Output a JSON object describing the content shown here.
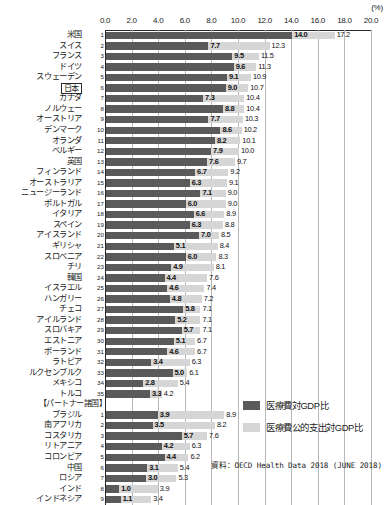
{
  "unit_label": "(%)",
  "source_note": "資料：OECD Health Data 2018 (JUNE 2018)",
  "legend": {
    "total_label": "医療費対GDP比",
    "public_label": "医療費公的支出対GDP比"
  },
  "partner_header": "【パートナー諸国】",
  "colors": {
    "total_bar": "#5a5a5a",
    "public_bar": "#d6d6d6",
    "grid": "#b8b8b8",
    "axis": "#2b2b2b",
    "text": "#1a1a1a",
    "background": "#ffffff"
  },
  "chart_data": {
    "type": "bar",
    "orientation": "horizontal",
    "title": "",
    "subtitle": "",
    "xlabel": "(%)",
    "ylabel": "",
    "xlim": [
      0.0,
      20.0
    ],
    "xticks": [
      "0.0",
      "2.0",
      "4.0",
      "6.0",
      "8.0",
      "10.0",
      "12.0",
      "14.0",
      "16.0",
      "18.0",
      "20.0"
    ],
    "xtick_values": [
      0.0,
      2.0,
      4.0,
      6.0,
      8.0,
      10.0,
      12.0,
      14.0,
      16.0,
      18.0,
      20.0
    ],
    "grid": true,
    "legend_position": "right-bottom",
    "series": [
      {
        "name": "医療費対GDP比",
        "color": "#5a5a5a"
      },
      {
        "name": "医療費公的支出対GDP比",
        "color": "#d6d6d6"
      }
    ],
    "groups": [
      {
        "name": "OECD諸国",
        "header": "",
        "rows": [
          {
            "rank": "1",
            "category": "米国",
            "total": 14.0,
            "public": 17.2,
            "highlight": false
          },
          {
            "rank": "2",
            "category": "スイス",
            "total": 7.7,
            "public": 12.3,
            "highlight": false
          },
          {
            "rank": "3",
            "category": "フランス",
            "total": 9.5,
            "public": 11.5,
            "highlight": false
          },
          {
            "rank": "4",
            "category": "ドイツ",
            "total": 9.6,
            "public": 11.3,
            "highlight": false
          },
          {
            "rank": "5",
            "category": "スウェーデン",
            "total": 9.1,
            "public": 10.9,
            "highlight": false
          },
          {
            "rank": "6",
            "category": "日本",
            "total": 9.0,
            "public": 10.7,
            "highlight": true
          },
          {
            "rank": "7",
            "category": "カナダ",
            "total": 7.3,
            "public": 10.4,
            "highlight": false
          },
          {
            "rank": "8",
            "category": "ノルウェー",
            "total": 8.8,
            "public": 10.4,
            "highlight": false
          },
          {
            "rank": "9",
            "category": "オーストリア",
            "total": 7.7,
            "public": 10.3,
            "highlight": false
          },
          {
            "rank": "10",
            "category": "デンマーク",
            "total": 8.6,
            "public": 10.2,
            "highlight": false
          },
          {
            "rank": "11",
            "category": "オランダ",
            "total": 8.2,
            "public": 10.1,
            "highlight": false
          },
          {
            "rank": "12",
            "category": "ベルギー",
            "total": 7.9,
            "public": 10.0,
            "highlight": false
          },
          {
            "rank": "13",
            "category": "英国",
            "total": 7.6,
            "public": 9.7,
            "highlight": false
          },
          {
            "rank": "14",
            "category": "フィンランド",
            "total": 6.7,
            "public": 9.2,
            "highlight": false
          },
          {
            "rank": "15",
            "category": "オーストラリア",
            "total": 6.3,
            "public": 9.1,
            "highlight": false
          },
          {
            "rank": "16",
            "category": "ニュージーランド",
            "total": 7.1,
            "public": 9.0,
            "highlight": false
          },
          {
            "rank": "17",
            "category": "ポルトガル",
            "total": 6.0,
            "public": 9.0,
            "highlight": false
          },
          {
            "rank": "18",
            "category": "イタリア",
            "total": 6.6,
            "public": 8.9,
            "highlight": false
          },
          {
            "rank": "19",
            "category": "スペイン",
            "total": 6.3,
            "public": 8.8,
            "highlight": false
          },
          {
            "rank": "20",
            "category": "アイスランド",
            "total": 7.0,
            "public": 8.5,
            "highlight": false
          },
          {
            "rank": "21",
            "category": "ギリシャ",
            "total": 5.1,
            "public": 8.4,
            "highlight": false
          },
          {
            "rank": "22",
            "category": "スロベニア",
            "total": 6.0,
            "public": 8.3,
            "highlight": false
          },
          {
            "rank": "23",
            "category": "チリ",
            "total": 4.9,
            "public": 8.1,
            "highlight": false
          },
          {
            "rank": "24",
            "category": "韓国",
            "total": 4.4,
            "public": 7.6,
            "highlight": false
          },
          {
            "rank": "25",
            "category": "イスラエル",
            "total": 4.6,
            "public": 7.4,
            "highlight": false
          },
          {
            "rank": "26",
            "category": "ハンガリー",
            "total": 4.8,
            "public": 7.2,
            "highlight": false
          },
          {
            "rank": "27",
            "category": "チェコ",
            "total": 5.8,
            "public": 7.1,
            "highlight": false
          },
          {
            "rank": "28",
            "category": "アイルランド",
            "total": 5.2,
            "public": 7.1,
            "highlight": false
          },
          {
            "rank": "29",
            "category": "スロバキア",
            "total": 5.7,
            "public": 7.1,
            "highlight": false
          },
          {
            "rank": "30",
            "category": "エストニア",
            "total": 5.1,
            "public": 6.7,
            "highlight": false
          },
          {
            "rank": "31",
            "category": "ポーランド",
            "total": 4.6,
            "public": 6.7,
            "highlight": false
          },
          {
            "rank": "32",
            "category": "ラトビア",
            "total": 3.4,
            "public": 6.3,
            "highlight": false
          },
          {
            "rank": "33",
            "category": "ルクセンブルク",
            "total": 5.0,
            "public": 6.1,
            "highlight": false
          },
          {
            "rank": "34",
            "category": "メキシコ",
            "total": 2.8,
            "public": 5.4,
            "highlight": false
          },
          {
            "rank": "35",
            "category": "トルコ",
            "total": 3.3,
            "public": 4.2,
            "highlight": false
          }
        ]
      },
      {
        "name": "パートナー諸国",
        "header": "【パートナー諸国】",
        "rows": [
          {
            "rank": "1",
            "category": "ブラジル",
            "total": 3.9,
            "public": 8.9,
            "highlight": false
          },
          {
            "rank": "2",
            "category": "南アフリカ",
            "total": 3.5,
            "public": 8.2,
            "highlight": false
          },
          {
            "rank": "3",
            "category": "コスタリカ",
            "total": 5.7,
            "public": 7.6,
            "highlight": false
          },
          {
            "rank": "4",
            "category": "リトアニア",
            "total": 4.2,
            "public": 6.3,
            "highlight": false
          },
          {
            "rank": "5",
            "category": "コロンビア",
            "total": 4.4,
            "public": 6.2,
            "highlight": false
          },
          {
            "rank": "6",
            "category": "中国",
            "total": 3.1,
            "public": 5.4,
            "highlight": false
          },
          {
            "rank": "7",
            "category": "ロシア",
            "total": 3.0,
            "public": 5.3,
            "highlight": false
          },
          {
            "rank": "8",
            "category": "インド",
            "total": 1.0,
            "public": 3.9,
            "highlight": false
          },
          {
            "rank": "9",
            "category": "インドネシア",
            "total": 1.1,
            "public": 3.4,
            "highlight": false
          }
        ]
      }
    ]
  }
}
